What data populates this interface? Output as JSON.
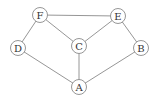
{
  "graph": {
    "nodes": [
      {
        "id": "F",
        "label": "F"
      },
      {
        "id": "E",
        "label": "E"
      },
      {
        "id": "D",
        "label": "D"
      },
      {
        "id": "C",
        "label": "C"
      },
      {
        "id": "B",
        "label": "B"
      },
      {
        "id": "A",
        "label": "A"
      }
    ],
    "edges": [
      [
        "F",
        "E"
      ],
      [
        "F",
        "D"
      ],
      [
        "F",
        "C"
      ],
      [
        "E",
        "C"
      ],
      [
        "E",
        "B"
      ],
      [
        "D",
        "A"
      ],
      [
        "C",
        "A"
      ],
      [
        "B",
        "A"
      ]
    ]
  }
}
